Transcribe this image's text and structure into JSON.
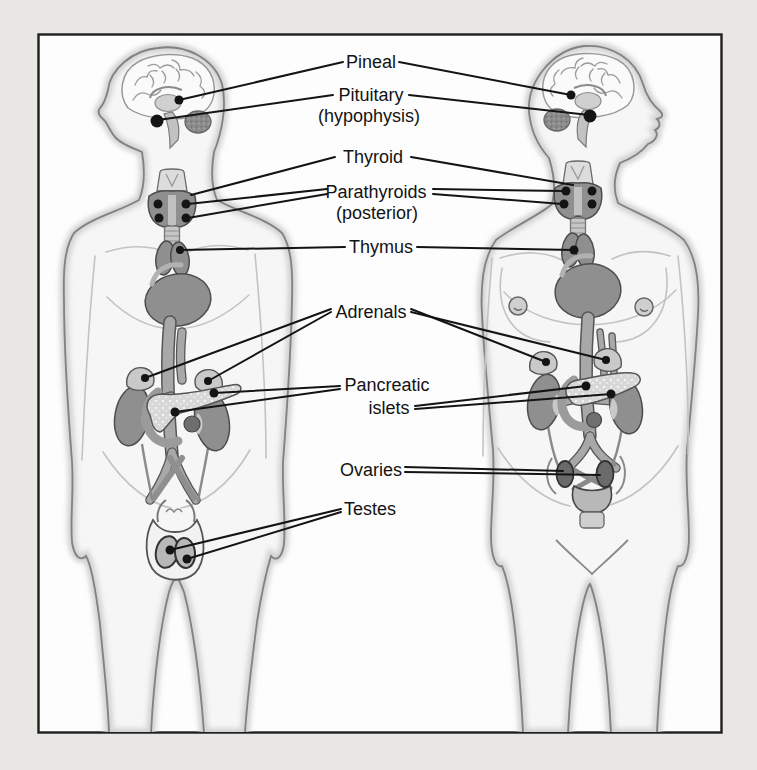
{
  "page": {
    "background_color": "#e9e7e3"
  },
  "panel": {
    "background_color": "#fdfdfd",
    "border_color": "#1f1f1f"
  },
  "figures": {
    "left": "male-figure",
    "right": "female-figure"
  },
  "labels": {
    "pineal": {
      "text": "Pineal"
    },
    "pituitary": {
      "text": "Pituitary",
      "sub": "(hypophysis)"
    },
    "thyroid": {
      "text": "Thyroid"
    },
    "parathyroids": {
      "text": "Parathyroids",
      "sub": "(posterior)"
    },
    "thymus": {
      "text": "Thymus"
    },
    "adrenals": {
      "text": "Adrenals"
    },
    "pancreatic_islets": {
      "text": "Pancreatic",
      "sub": "islets"
    },
    "ovaries": {
      "text": "Ovaries"
    },
    "testes": {
      "text": "Testes"
    }
  },
  "colors": {
    "leader_line": "#141414",
    "marker_dot": "#141414",
    "organ_dark": "#8f8f8f",
    "organ_light": "#d9d9d9",
    "body_outline": "#828282"
  }
}
